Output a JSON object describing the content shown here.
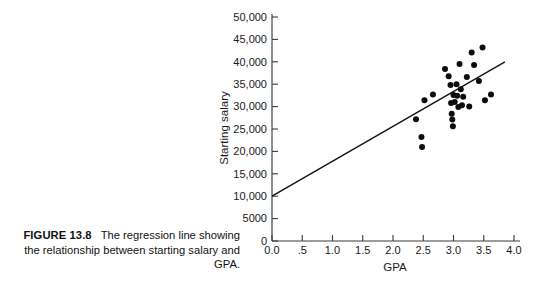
{
  "caption": {
    "figure_number": "FIGURE 13.8",
    "text": "The regression line showing the relationship between starting salary and GPA."
  },
  "chart_data": {
    "type": "scatter",
    "title": "",
    "xlabel": "GPA",
    "ylabel": "Starting salary",
    "xlim": [
      0.0,
      4.0
    ],
    "ylim": [
      0,
      50000
    ],
    "grid": false,
    "legend": null,
    "xticks": [
      0.0,
      0.5,
      1.0,
      1.5,
      2.0,
      2.5,
      3.0,
      3.5,
      4.0
    ],
    "xtick_labels": [
      "0.0",
      ".5",
      "1.0",
      "1.5",
      "2.0",
      "2.5",
      "3.0",
      "3.5",
      "4.0"
    ],
    "yticks": [
      0,
      5000,
      10000,
      15000,
      20000,
      25000,
      30000,
      35000,
      40000,
      45000,
      50000
    ],
    "ytick_labels": [
      "0",
      "5000",
      "10,000",
      "15,000",
      "20,000",
      "25,000",
      "30,000",
      "35,000",
      "40,000",
      "45,000",
      "50,000"
    ],
    "points": [
      {
        "x": 2.38,
        "y": 27200
      },
      {
        "x": 2.47,
        "y": 23200
      },
      {
        "x": 2.48,
        "y": 21000
      },
      {
        "x": 2.52,
        "y": 31400
      },
      {
        "x": 2.66,
        "y": 32700
      },
      {
        "x": 2.86,
        "y": 38400
      },
      {
        "x": 2.92,
        "y": 36800
      },
      {
        "x": 2.95,
        "y": 34800
      },
      {
        "x": 2.96,
        "y": 30800
      },
      {
        "x": 2.97,
        "y": 28400
      },
      {
        "x": 2.98,
        "y": 27100
      },
      {
        "x": 2.99,
        "y": 25600
      },
      {
        "x": 3.0,
        "y": 32600
      },
      {
        "x": 3.02,
        "y": 31000
      },
      {
        "x": 3.05,
        "y": 35000
      },
      {
        "x": 3.06,
        "y": 32400
      },
      {
        "x": 3.08,
        "y": 29900
      },
      {
        "x": 3.1,
        "y": 39500
      },
      {
        "x": 3.12,
        "y": 33900
      },
      {
        "x": 3.14,
        "y": 30300
      },
      {
        "x": 3.16,
        "y": 32200
      },
      {
        "x": 3.22,
        "y": 36600
      },
      {
        "x": 3.26,
        "y": 30000
      },
      {
        "x": 3.3,
        "y": 42100
      },
      {
        "x": 3.34,
        "y": 39300
      },
      {
        "x": 3.42,
        "y": 35700
      },
      {
        "x": 3.48,
        "y": 43200
      },
      {
        "x": 3.52,
        "y": 31400
      },
      {
        "x": 3.62,
        "y": 32700
      }
    ],
    "regression_line": {
      "x_start": 0.0,
      "y_start": 10000,
      "x_end": 3.85,
      "y_end": 40000
    }
  }
}
